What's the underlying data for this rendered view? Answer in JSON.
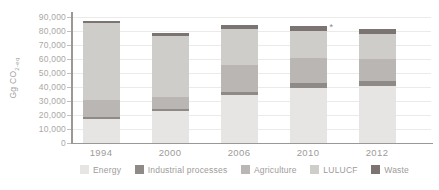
{
  "figure": {
    "y_axis": {
      "title_main": "Gg CO",
      "title_sub": "2-eq",
      "tick_labels": [
        "0",
        "10,000",
        "20,000",
        "30,000",
        "40,000",
        "50,000",
        "60,000",
        "70,000",
        "80,000",
        "90,000"
      ]
    },
    "x_axis": {
      "labels": [
        "1994",
        "2000",
        "2006",
        "2010",
        "2012"
      ]
    }
  },
  "chart_data": {
    "type": "bar",
    "stacked": true,
    "title": "",
    "xlabel": "",
    "ylabel": "Gg CO2-eq",
    "ylim": [
      0,
      90000
    ],
    "ytick_step": 10000,
    "grid": true,
    "legend_position": "bottom",
    "categories": [
      "1994",
      "2000",
      "2006",
      "2010",
      "2012"
    ],
    "series": [
      {
        "name": "Energy",
        "color": "#e6e5e3",
        "values": [
          17000,
          22500,
          34000,
          39500,
          40500
        ]
      },
      {
        "name": "Industrial processes",
        "color": "#8d8a88",
        "values": [
          1500,
          2000,
          2500,
          3000,
          4000
        ]
      },
      {
        "name": "Agriculture",
        "color": "#b9b6b3",
        "values": [
          12500,
          8000,
          19000,
          18000,
          15500
        ]
      },
      {
        "name": "LULUCF",
        "color": "#cfcdca",
        "values": [
          54500,
          44000,
          25500,
          19500,
          17500
        ]
      },
      {
        "name": "Waste",
        "color": "#7c7472",
        "values": [
          1500,
          2000,
          3000,
          3500,
          4000
        ]
      }
    ],
    "totals": [
      87000,
      78500,
      84000,
      83500,
      81500
    ],
    "annotations": [
      {
        "text": "*",
        "category": "2010",
        "position": "above-top-right"
      }
    ]
  }
}
